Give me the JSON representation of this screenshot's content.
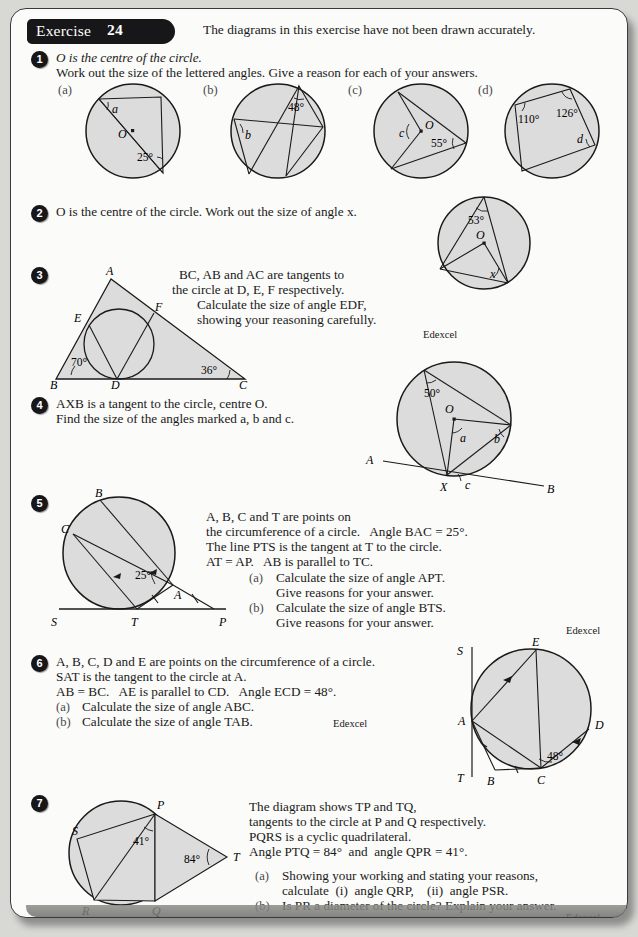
{
  "header": {
    "exercise_word": "Exercise",
    "exercise_number": "24",
    "note": "The diagrams in this exercise have not been drawn accurately."
  },
  "attribution": "Edexcel",
  "questions": [
    {
      "number": "1",
      "lines": [
        "O is the centre of the circle.",
        "Work out the size of the lettered angles. Give a reason for each of your answers."
      ],
      "parts": [
        "(a)",
        "(b)",
        "(c)",
        "(d)"
      ],
      "diagrams": {
        "a": {
          "centre_label": "O",
          "angle_known": "25°",
          "angle_unknown": "a"
        },
        "b": {
          "angle_known": "48°",
          "angle_unknown": "b"
        },
        "c": {
          "centre_label": "O",
          "angle_known": "55°",
          "angle_unknown": "c"
        },
        "d": {
          "angle_known_1": "110°",
          "angle_known_2": "126°",
          "angle_unknown": "d"
        }
      }
    },
    {
      "number": "2",
      "lines": [
        "O is the centre of the circle. Work out the size of angle x."
      ],
      "diagram": {
        "centre_label": "O",
        "angle_known": "53°",
        "angle_unknown": "x"
      }
    },
    {
      "number": "3",
      "lines": [
        "BC, AB and AC are tangents to",
        "the circle at D, E, F respectively.",
        "Calculate the size of angle EDF,",
        "showing your reasoning carefully."
      ],
      "diagram": {
        "vertices": [
          "A",
          "B",
          "C"
        ],
        "touch_points": [
          "D",
          "E",
          "F"
        ],
        "angle_B": "70°",
        "angle_C": "36°"
      }
    },
    {
      "number": "4",
      "lines": [
        "AXB is a tangent to the circle, centre O.",
        "Find the size of the angles marked a, b and c."
      ],
      "diagram": {
        "centre_label": "O",
        "angle_known": "50°",
        "unknowns": [
          "a",
          "b",
          "c"
        ],
        "tangent_labels": [
          "A",
          "X",
          "B"
        ]
      }
    },
    {
      "number": "5",
      "lines": [
        "A, B, C and T are points on",
        "the circumference of a circle.   Angle BAC = 25°.",
        "The line PTS is the tangent at T to the circle.",
        "AT = AP.   AB is parallel to TC."
      ],
      "subparts": [
        {
          "tag": "(a)",
          "text": [
            "Calculate the size of angle APT.",
            "Give reasons for your answer."
          ]
        },
        {
          "tag": "(b)",
          "text": [
            "Calculate the size of angle BTS.",
            "Give reasons for your answer."
          ]
        }
      ],
      "diagram": {
        "points": [
          "A",
          "B",
          "C",
          "S",
          "T",
          "P"
        ],
        "angle_known": "25°"
      }
    },
    {
      "number": "6",
      "lines": [
        "A, B, C, D and E are points on the circumference of a circle.",
        "SAT is the tangent to the circle at A.",
        "AB = BC.   AE is parallel to CD.   Angle ECD = 48°."
      ],
      "subparts": [
        {
          "tag": "(a)",
          "text": [
            "Calculate the size of angle ABC."
          ]
        },
        {
          "tag": "(b)",
          "text": [
            "Calculate the size of angle TAB."
          ]
        }
      ],
      "diagram": {
        "points": [
          "S",
          "A",
          "B",
          "C",
          "D",
          "E",
          "T"
        ],
        "angle_known": "48°"
      }
    },
    {
      "number": "7",
      "lines": [
        "The diagram shows TP and TQ,",
        "tangents to the circle at P and Q respectively.",
        "PQRS is a cyclic quadrilateral.",
        "Angle PTQ = 84°  and  angle QPR = 41°."
      ],
      "subparts": [
        {
          "tag": "(a)",
          "text": [
            "Showing your working and stating your reasons,",
            "calculate  (i)  angle QRP,    (ii)  angle PSR."
          ]
        },
        {
          "tag": "(b)",
          "text": [
            "Is PR a diameter of the circle? Explain your answer."
          ]
        }
      ],
      "diagram": {
        "points": [
          "P",
          "Q",
          "R",
          "S",
          "T"
        ],
        "angle_1": "41°",
        "angle_2": "84°"
      }
    }
  ]
}
